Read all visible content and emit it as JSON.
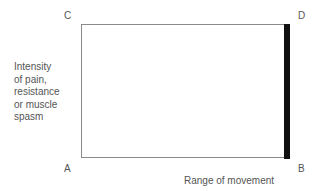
{
  "corners": {
    "C": "C",
    "D": "D",
    "A": "A",
    "B": "B"
  },
  "y_axis": {
    "lines": [
      "Intensity",
      "of pain,",
      "resistance",
      "or muscle",
      "spasm"
    ]
  },
  "x_axis": {
    "label": "Range of movement"
  },
  "colors": {
    "box_line": "#8a8a8a",
    "bar": "#111111"
  }
}
